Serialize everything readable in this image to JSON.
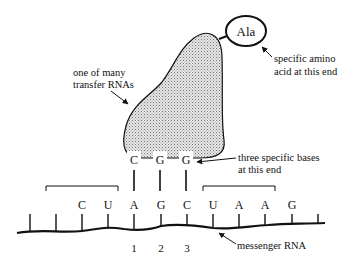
{
  "diagram": {
    "trna_label": [
      "one of many",
      "transfer RNAs"
    ],
    "amino_acid": "Ala",
    "amino_acid_label": [
      "specific amino",
      "acid at this end"
    ],
    "anticodon": [
      "C",
      "G",
      "G"
    ],
    "anticodon_label": [
      "three specific bases",
      "at this end"
    ],
    "mrna_bases": [
      "C",
      "U",
      "A",
      "G",
      "C",
      "U",
      "A",
      "A",
      "G"
    ],
    "codon_numbers": [
      "1",
      "2",
      "3"
    ],
    "mrna_label": "messenger RNA",
    "colors": {
      "line": "#111111",
      "fill": "#d8d8d8",
      "background": "#ffffff"
    }
  }
}
